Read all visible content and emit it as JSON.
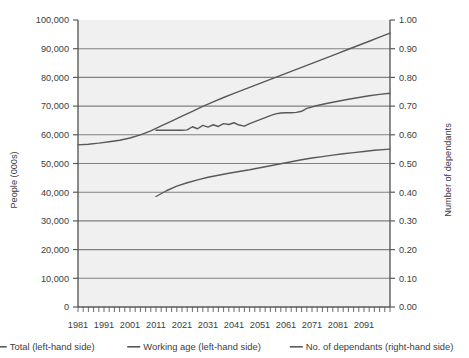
{
  "chart_data": {
    "type": "line",
    "title": "",
    "plot_background": "#f0f0f0",
    "grid": true,
    "grid_color": "#808080",
    "legend_position": "bottom",
    "series_color": "#595959",
    "x": [
      1981,
      1991,
      2001,
      2011,
      2021,
      2031,
      2041,
      2051,
      2061,
      2071,
      2081,
      2091
    ],
    "xlabel": "",
    "xtick_labels": [
      "1981",
      "1991",
      "2001",
      "2011",
      "2021",
      "2031",
      "2041",
      "2051",
      "2061",
      "2071",
      "2081",
      "2091"
    ],
    "xlim": [
      1981,
      2101
    ],
    "minor_tick_interval": 2,
    "left_axis": {
      "ylabel": "People (000s)",
      "ylim": [
        0,
        100000
      ],
      "ytick_labels": [
        "100,000",
        "90,000",
        "80,000",
        "70,000",
        "60,000",
        "50,000",
        "40,000",
        "30,000",
        "20,000",
        "10,000",
        "0"
      ],
      "ytick_values": [
        100000,
        90000,
        80000,
        70000,
        60000,
        50000,
        40000,
        30000,
        20000,
        10000,
        0
      ]
    },
    "right_axis": {
      "ylabel": "Number of dependants",
      "ylim": [
        0,
        1.0
      ],
      "ytick_labels": [
        "1.00",
        "0.90",
        "0.80",
        "0.70",
        "0.60",
        "0.50",
        "0.40",
        "0.30",
        "0.20",
        "0.10",
        "0.00"
      ],
      "ytick_values": [
        1.0,
        0.9,
        0.8,
        0.7,
        0.6,
        0.5,
        0.4,
        0.3,
        0.2,
        0.1,
        0.0
      ]
    },
    "series": [
      {
        "name": "Total (left-hand side)",
        "axis": "left",
        "legend_label": "Total (left-hand side)",
        "x": [
          1981,
          1985,
          1989,
          1993,
          1997,
          2001,
          2005,
          2009,
          2013,
          2017,
          2021,
          2025,
          2029,
          2033,
          2037,
          2041,
          2045,
          2049,
          2053,
          2057,
          2061,
          2065,
          2069,
          2073,
          2077,
          2081,
          2085,
          2089,
          2093,
          2097,
          2101
        ],
        "values": [
          56500,
          56700,
          57100,
          57600,
          58100,
          58900,
          60000,
          61400,
          63100,
          64800,
          66500,
          68200,
          69900,
          71500,
          73000,
          74400,
          75800,
          77200,
          78600,
          80000,
          81400,
          82800,
          84200,
          85600,
          87000,
          88400,
          89800,
          91200,
          92600,
          94000,
          95400
        ]
      },
      {
        "name": "Working age (left-hand side)",
        "axis": "left",
        "legend_label": "Working age (left-hand side)",
        "x": [
          2011,
          2013,
          2015,
          2017,
          2019,
          2021,
          2023,
          2025,
          2027,
          2029,
          2031,
          2033,
          2035,
          2037,
          2039,
          2041,
          2043,
          2045,
          2047,
          2049,
          2051,
          2053,
          2055,
          2057,
          2059,
          2061,
          2063,
          2065,
          2067,
          2069,
          2073,
          2077,
          2081,
          2085,
          2089,
          2093,
          2097,
          2101
        ],
        "values": [
          61600,
          61600,
          61600,
          61600,
          61600,
          61600,
          61700,
          62800,
          62100,
          63300,
          62700,
          63500,
          62900,
          63900,
          63600,
          64200,
          63400,
          63000,
          63900,
          64600,
          65300,
          66000,
          66700,
          67300,
          67600,
          67700,
          67700,
          67800,
          68200,
          69200,
          70200,
          71000,
          71700,
          72400,
          73000,
          73600,
          74100,
          74500
        ]
      },
      {
        "name": "No. of dependants (right-hand side)",
        "axis": "right",
        "legend_label": "No. of dependants (right-hand side)",
        "x": [
          2011,
          2015,
          2019,
          2023,
          2027,
          2031,
          2035,
          2039,
          2043,
          2047,
          2051,
          2055,
          2059,
          2063,
          2067,
          2071,
          2075,
          2079,
          2083,
          2087,
          2091,
          2095,
          2101
        ],
        "values": [
          0.385,
          0.405,
          0.421,
          0.433,
          0.443,
          0.452,
          0.459,
          0.466,
          0.472,
          0.478,
          0.485,
          0.492,
          0.499,
          0.506,
          0.513,
          0.519,
          0.524,
          0.529,
          0.534,
          0.538,
          0.542,
          0.546,
          0.55
        ]
      }
    ]
  },
  "legend": {
    "items": [
      {
        "label": "Total (left-hand side)"
      },
      {
        "label": "Working age (left-hand side)"
      },
      {
        "label": "No. of dependants (right-hand side)"
      }
    ]
  }
}
